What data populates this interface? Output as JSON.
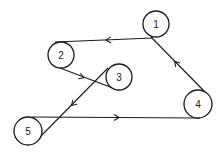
{
  "diagram": {
    "type": "directed-graph",
    "nodes": [
      {
        "id": "1",
        "label": "1",
        "cx": 156,
        "cy": 24,
        "r": 13
      },
      {
        "id": "2",
        "label": "2",
        "cx": 61,
        "cy": 55,
        "r": 13
      },
      {
        "id": "3",
        "label": "3",
        "cx": 119,
        "cy": 77,
        "r": 13
      },
      {
        "id": "4",
        "label": "4",
        "cx": 198,
        "cy": 104,
        "r": 14
      },
      {
        "id": "5",
        "label": "5",
        "cx": 28,
        "cy": 131,
        "r": 14
      }
    ],
    "edges": [
      {
        "from": "1",
        "to": "2",
        "x1": 153,
        "y1": 38,
        "x2": 55,
        "y2": 42,
        "ax": 108,
        "ay": 40
      },
      {
        "from": "2",
        "to": "3",
        "x1": 60,
        "y1": 68,
        "x2": 118,
        "y2": 90,
        "ax": 82,
        "ay": 77
      },
      {
        "from": "3",
        "to": "5",
        "x1": 108,
        "y1": 68,
        "x2": 39,
        "y2": 138,
        "ax": 73,
        "ay": 104
      },
      {
        "from": "5",
        "to": "4",
        "x1": 32,
        "y1": 117,
        "x2": 200,
        "y2": 118,
        "ax": 117,
        "ay": 117.5
      },
      {
        "from": "4",
        "to": "1",
        "x1": 204,
        "y1": 91,
        "x2": 151,
        "y2": 37,
        "ax": 176,
        "ay": 63
      }
    ],
    "colors": {
      "stroke": "#1a1a1a",
      "background": "#ffffff"
    }
  }
}
